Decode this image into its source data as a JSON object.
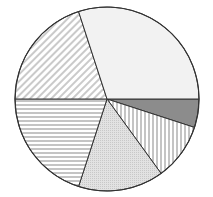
{
  "chart_data": {
    "type": "pie",
    "title": "",
    "start_angle_deg": 0,
    "direction": "clockwise",
    "center": [
      107,
      99
    ],
    "radius": 92,
    "slices": [
      {
        "name": "Slice 1",
        "value": 5,
        "pattern": "solid-dark",
        "fill": "#8c8c8c"
      },
      {
        "name": "Slice 2",
        "value": 10,
        "pattern": "vertical-lines",
        "fill": "#ffffff"
      },
      {
        "name": "Slice 3",
        "value": 15,
        "pattern": "dots",
        "fill": "#e6e6e6"
      },
      {
        "name": "Slice 4",
        "value": 20,
        "pattern": "horizontal-lines",
        "fill": "#ffffff"
      },
      {
        "name": "Slice 5",
        "value": 20,
        "pattern": "diagonal-lines",
        "fill": "#ffffff"
      },
      {
        "name": "Slice 6",
        "value": 30,
        "pattern": "solid-light",
        "fill": "#f2f2f2"
      }
    ],
    "categories": [
      "Slice 1",
      "Slice 2",
      "Slice 3",
      "Slice 4",
      "Slice 5",
      "Slice 6"
    ],
    "values": [
      5,
      10,
      15,
      20,
      20,
      30
    ],
    "legend": "none",
    "stroke": "#333333"
  }
}
